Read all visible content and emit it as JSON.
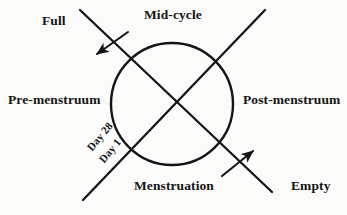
{
  "diagram": {
    "background_color": "#fbfbf9",
    "stroke_color": "#151515",
    "labels": {
      "mid_cycle": "Mid-cycle",
      "menstruation": "Menstruation",
      "pre_menstruum": "Pre-menstruum",
      "post_menstruum": "Post-menstruum",
      "full": "Full",
      "empty": "Empty",
      "day_28": "Day 28",
      "day_1": "Day 1"
    },
    "shapes": {
      "circle": {
        "cx": 172,
        "cy": 104,
        "r": 61
      },
      "axis_nw_se": {
        "x1": 80,
        "y1": 10,
        "x2": 272,
        "y2": 192
      },
      "axis_ne_sw": {
        "x1": 265,
        "y1": 10,
        "x2": 83,
        "y2": 200
      },
      "arrow_full": {
        "x1": 128,
        "y1": 32,
        "x2": 96,
        "y2": 55,
        "direction": "down-left"
      },
      "arrow_empty": {
        "x1": 222,
        "y1": 176,
        "x2": 254,
        "y2": 150,
        "direction": "up-right"
      }
    }
  }
}
